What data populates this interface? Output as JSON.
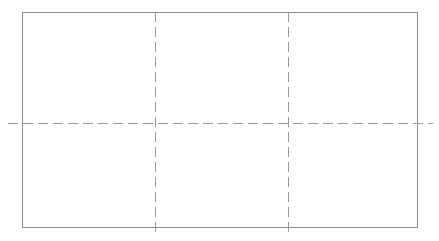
{
  "overlay": {
    "name": "rule-of-thirds-grid-overlay",
    "background_color": "#ffffff",
    "frame": {
      "label": "",
      "stroke_color": "#8c8c8c",
      "stroke_width": 1,
      "left": 22,
      "top": 12,
      "width": 396,
      "height": 216
    },
    "guides": {
      "stroke_color": "#9a9a9a",
      "stroke_width": 1,
      "dash_length": 10,
      "gap_length": 5,
      "vertical": [
        {
          "name": "vertical-guide-left",
          "x": 155,
          "top": 12,
          "bottom": 233
        },
        {
          "name": "vertical-guide-right",
          "x": 288,
          "top": 12,
          "bottom": 233
        }
      ],
      "horizontal": [
        {
          "name": "horizontal-guide-middle",
          "y": 123,
          "left": 8,
          "right": 433
        }
      ]
    },
    "cells": [
      {
        "name": "cell-top-left",
        "label": ""
      },
      {
        "name": "cell-top-center",
        "label": ""
      },
      {
        "name": "cell-top-right",
        "label": ""
      },
      {
        "name": "cell-bottom-left",
        "label": ""
      },
      {
        "name": "cell-bottom-center",
        "label": ""
      },
      {
        "name": "cell-bottom-right",
        "label": ""
      }
    ]
  }
}
